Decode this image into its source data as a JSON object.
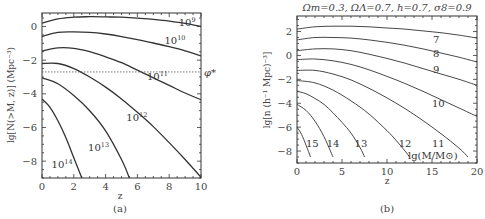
{
  "chart_data": [
    {
      "type": "line",
      "panel": "a",
      "caption": "(a)",
      "title": "",
      "xlabel": "z",
      "ylabel": "lg[N(>M, z)] (Mpc⁻³)",
      "xlim": [
        0,
        10
      ],
      "ylim": [
        -9,
        0.8
      ],
      "xticks": [
        0,
        2,
        4,
        6,
        8,
        10
      ],
      "yticks": [
        0,
        -2,
        -4,
        -6,
        -8
      ],
      "grid": false,
      "reference_line": {
        "y": -2.7,
        "label": "φ*",
        "style": "dotted"
      },
      "series": [
        {
          "name": "10^9",
          "label_main": "10",
          "label_exp": "9",
          "x": [
            0,
            1,
            2,
            3,
            4,
            5,
            6,
            7,
            8,
            9,
            10
          ],
          "y": [
            0.2,
            0.45,
            0.55,
            0.58,
            0.57,
            0.55,
            0.5,
            0.42,
            0.32,
            0.18,
            0.0
          ]
        },
        {
          "name": "10^10",
          "label_main": "10",
          "label_exp": "10",
          "x": [
            0,
            1,
            2,
            3,
            4,
            5,
            6,
            7,
            8,
            9,
            10
          ],
          "y": [
            -0.6,
            -0.35,
            -0.32,
            -0.35,
            -0.45,
            -0.6,
            -0.78,
            -0.98,
            -1.2,
            -1.45,
            -1.75
          ]
        },
        {
          "name": "10^11",
          "label_main": "10",
          "label_exp": "11",
          "x": [
            0,
            1,
            2,
            3,
            4,
            5,
            6,
            7,
            8,
            9,
            10
          ],
          "y": [
            -1.45,
            -1.27,
            -1.3,
            -1.5,
            -1.8,
            -2.15,
            -2.6,
            -3.05,
            -3.5,
            -3.95,
            -4.35
          ]
        },
        {
          "name": "10^12",
          "label_main": "10",
          "label_exp": "12",
          "x": [
            0,
            1,
            2,
            3,
            4,
            5,
            6,
            7,
            8,
            9,
            10
          ],
          "y": [
            -2.2,
            -2.2,
            -2.5,
            -3.0,
            -3.6,
            -4.3,
            -5.1,
            -5.95,
            -6.9,
            -7.9,
            -8.95
          ]
        },
        {
          "name": "10^13",
          "label_main": "10",
          "label_exp": "13",
          "x": [
            0,
            1,
            2,
            3,
            4,
            5,
            5.5
          ],
          "y": [
            -3.05,
            -3.4,
            -4.1,
            -5.0,
            -6.2,
            -7.9,
            -9.0
          ]
        },
        {
          "name": "10^14",
          "label_main": "10",
          "label_exp": "14",
          "x": [
            0,
            0.5,
            1,
            1.5,
            2,
            2.5
          ],
          "y": [
            -4.3,
            -4.8,
            -5.6,
            -6.6,
            -7.8,
            -9.0
          ]
        }
      ]
    },
    {
      "type": "line",
      "panel": "b",
      "caption": "(b)",
      "title": "Ωm=0.3, ΩΛ=0.7, h=0.7, σ8=0.9",
      "xlabel": "z",
      "ylabel": "lg[n (h⁻¹ Mpc)⁻³]",
      "xlim": [
        0,
        20
      ],
      "ylim": [
        -9,
        3.3
      ],
      "xticks": [
        0,
        5,
        10,
        15,
        20
      ],
      "yticks": [
        2,
        0,
        -2,
        -4,
        -6,
        -8
      ],
      "grid": false,
      "legend_annotation": "lg(M/M⊙)",
      "series": [
        {
          "name": "7",
          "x": [
            0,
            2,
            4,
            6,
            8,
            10,
            12,
            14,
            16,
            18,
            20
          ],
          "y": [
            2.2,
            2.4,
            2.45,
            2.45,
            2.4,
            2.3,
            2.2,
            2.05,
            1.9,
            1.7,
            1.45
          ]
        },
        {
          "name": "8",
          "x": [
            0,
            2,
            4,
            6,
            8,
            10,
            12,
            14,
            16,
            18,
            20
          ],
          "y": [
            1.3,
            1.5,
            1.5,
            1.45,
            1.3,
            1.1,
            0.85,
            0.55,
            0.2,
            -0.15,
            -0.55
          ]
        },
        {
          "name": "9",
          "x": [
            0,
            2,
            4,
            6,
            8,
            10,
            12,
            14,
            16,
            18,
            20
          ],
          "y": [
            0.4,
            0.55,
            0.55,
            0.4,
            0.1,
            -0.25,
            -0.65,
            -1.1,
            -1.55,
            -2.0,
            -2.5
          ]
        },
        {
          "name": "10",
          "x": [
            0,
            2,
            4,
            6,
            8,
            10,
            12,
            14,
            16,
            18,
            20
          ],
          "y": [
            -0.35,
            -0.3,
            -0.45,
            -0.75,
            -1.2,
            -1.75,
            -2.35,
            -3.0,
            -3.7,
            -4.4,
            -5.1
          ]
        },
        {
          "name": "11",
          "x": [
            0,
            2,
            4,
            6,
            8,
            10,
            12,
            14,
            16,
            18,
            19
          ],
          "y": [
            -1.25,
            -1.25,
            -1.55,
            -2.05,
            -2.75,
            -3.55,
            -4.45,
            -5.45,
            -6.55,
            -7.75,
            -8.5
          ]
        },
        {
          "name": "12",
          "x": [
            0,
            2,
            4,
            6,
            8,
            10,
            11,
            12,
            12.5
          ],
          "y": [
            -2.1,
            -2.3,
            -2.9,
            -3.8,
            -4.9,
            -6.3,
            -7.1,
            -8.0,
            -8.5
          ]
        },
        {
          "name": "13",
          "x": [
            0,
            1,
            2,
            3,
            4,
            5,
            6,
            7,
            7.5
          ],
          "y": [
            -3.0,
            -3.2,
            -3.6,
            -4.1,
            -4.8,
            -5.6,
            -6.5,
            -7.7,
            -8.5
          ]
        },
        {
          "name": "14",
          "x": [
            0,
            1,
            2,
            3,
            4
          ],
          "y": [
            -4.1,
            -4.6,
            -5.5,
            -6.8,
            -8.5
          ]
        },
        {
          "name": "15",
          "x": [
            0,
            0.5,
            1,
            1.5
          ],
          "y": [
            -6.0,
            -6.6,
            -7.5,
            -8.5
          ]
        }
      ]
    }
  ],
  "panel_a": {
    "caption": "(a)",
    "xlabel": "z",
    "ylabel": "lg[N(>M, z)] (Mpc⁻³)",
    "phi_label": "φ*",
    "xticks": [
      "0",
      "2",
      "4",
      "6",
      "8",
      "10"
    ],
    "yticks": [
      "0",
      "−2",
      "−4",
      "−6",
      "−8"
    ]
  },
  "panel_b": {
    "caption": "(b)",
    "title": "Ωm=0.3, ΩΛ=0.7, h=0.7, σ8=0.9",
    "xlabel": "z",
    "ylabel": "lg[n (h⁻¹ Mpc)⁻³]",
    "annotation": "lg(M/M⊙)",
    "xticks": [
      "0",
      "5",
      "10",
      "15",
      "20"
    ],
    "yticks": [
      "2",
      "0",
      "−2",
      "−4",
      "−6",
      "−8"
    ]
  }
}
